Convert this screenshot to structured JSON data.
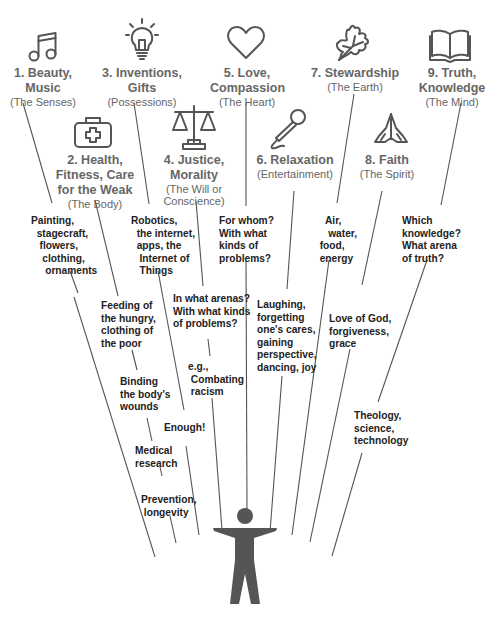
{
  "diagram": {
    "domains": [
      {
        "id": "beauty",
        "title": "1. Beauty,\nMusic",
        "subtitle": "(The Senses)",
        "icon": "music-note-icon"
      },
      {
        "id": "health",
        "title": "2. Health,\nFitness, Care\nfor the Weak",
        "subtitle": "(The Body)",
        "icon": "first-aid-kit-icon"
      },
      {
        "id": "inventions",
        "title": "3. Inventions,\nGifts",
        "subtitle": "(Possessions)",
        "icon": "light-bulb-icon"
      },
      {
        "id": "justice",
        "title": "4. Justice,\nMorality",
        "subtitle": "(The Will or\nConscience)",
        "icon": "scales-of-justice-icon"
      },
      {
        "id": "love",
        "title": "5. Love,\nCompassion",
        "subtitle": "(The Heart)",
        "icon": "heart-icon"
      },
      {
        "id": "relaxation",
        "title": "6. Relaxation",
        "subtitle": "(Entertainment)",
        "icon": "microphone-icon"
      },
      {
        "id": "stewardship",
        "title": "7. Stewardship",
        "subtitle": "(The Earth)",
        "icon": "leaf-icon"
      },
      {
        "id": "faith",
        "title": "8. Faith",
        "subtitle": "(The Spirit)",
        "icon": "praying-hands-icon"
      },
      {
        "id": "truth",
        "title": "9. Truth,\nKnowledge",
        "subtitle": "(The Mind)",
        "icon": "open-book-icon"
      }
    ],
    "notes": {
      "beauty": "Painting,\n  stagecraft,\n   flowers,\n    clothing,\n     ornaments",
      "inventions": "Robotics,\n  the internet,\n  apps, the\n   Internet of\n   Things",
      "love": "For whom?\nWith what\nkinds of\nproblems?",
      "stewardship": "    Air,\n     water,\n  food,\n  energy",
      "truth": "Which\nknowledge?\nWhat arena\nof truth?",
      "health_1": "Feeding of\nthe hungry,\nclothing of\nthe poor",
      "justice_1": "In what arenas?\nWith what kinds\nof problems?",
      "relaxation": "Laughing,\nforgetting\none's cares,\ngaining\nperspective,\ndancing, joy",
      "faith": "Love of God,\nforgiveness,\ngrace",
      "health_2": "Binding\nthe body's\nwounds",
      "justice_2": "e.g.,\n Combating\n racism",
      "inventions_2": "Enough!",
      "health_3": "Medical\nresearch",
      "truth_2": "Theology,\nscience,\ntechnology",
      "health_4": "Prevention,\n longevity"
    },
    "colors": {
      "icon": "#555555",
      "domain_text": "#666666",
      "note_text": "#222222",
      "figure": "#555555"
    }
  }
}
